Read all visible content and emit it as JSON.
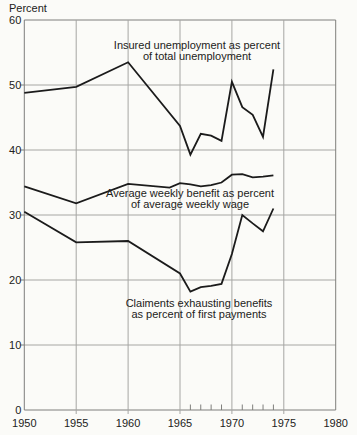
{
  "figure": {
    "unit_label": "Percent",
    "background": "#fbfbf8"
  },
  "chart_data": {
    "type": "line",
    "title": "Percent",
    "xlabel": "",
    "ylabel": "Percent",
    "grid": true,
    "legend_position": "inline-annotations",
    "x_axis": {
      "min": 1950,
      "max": 1980,
      "major_ticks": [
        1950,
        1955,
        1960,
        1965,
        1970,
        1975,
        1980
      ],
      "minor_ticks": [
        1966,
        1967,
        1968,
        1969,
        1971,
        1972,
        1973,
        1974
      ]
    },
    "y_axis": {
      "min": 0,
      "max": 60,
      "ticks": [
        0,
        10,
        20,
        30,
        40,
        50,
        60
      ]
    },
    "series": [
      {
        "name": "insured-unemployment",
        "label_lines": [
          "Insured unemployment as percent",
          "of total unemployment"
        ],
        "label_anchor": {
          "x": 197,
          "y": 48.5
        },
        "points": [
          [
            1950,
            48.8
          ],
          [
            1955,
            49.7
          ],
          [
            1960,
            53.5
          ],
          [
            1965,
            43.7
          ],
          [
            1966,
            39.3
          ],
          [
            1967,
            42.5
          ],
          [
            1968,
            42.2
          ],
          [
            1969,
            41.4
          ],
          [
            1970,
            50.5
          ],
          [
            1971,
            46.6
          ],
          [
            1972,
            45.4
          ],
          [
            1973,
            42.0
          ],
          [
            1974,
            52.4
          ]
        ]
      },
      {
        "name": "average-weekly-benefit",
        "label_lines": [
          "Average weekly benefit as percent",
          "of average weekly wage"
        ],
        "label_anchor": {
          "x": 190,
          "y": 197
        },
        "points": [
          [
            1950,
            34.4
          ],
          [
            1955,
            31.8
          ],
          [
            1960,
            34.8
          ],
          [
            1964,
            34.2
          ],
          [
            1965,
            34.9
          ],
          [
            1966,
            34.7
          ],
          [
            1967,
            34.4
          ],
          [
            1968,
            34.6
          ],
          [
            1969,
            35.0
          ],
          [
            1970,
            36.2
          ],
          [
            1971,
            36.3
          ],
          [
            1972,
            35.8
          ],
          [
            1973,
            35.9
          ],
          [
            1974,
            36.1
          ]
        ]
      },
      {
        "name": "claimants-exhausting-benefits",
        "label_lines": [
          "Claiments exhausting benefits",
          "as percent of first payments"
        ],
        "label_anchor": {
          "x": 199,
          "y": 307
        },
        "points": [
          [
            1950,
            30.5
          ],
          [
            1955,
            25.8
          ],
          [
            1960,
            26.0
          ],
          [
            1965,
            21.0
          ],
          [
            1966,
            18.2
          ],
          [
            1967,
            18.9
          ],
          [
            1968,
            19.1
          ],
          [
            1969,
            19.4
          ],
          [
            1970,
            24.0
          ],
          [
            1971,
            30.0
          ],
          [
            1972,
            28.7
          ],
          [
            1973,
            27.5
          ],
          [
            1974,
            31.0
          ]
        ]
      }
    ],
    "colors": {
      "line": "#1b1b1b",
      "grid": "#a6a6a3",
      "axis": "#7f7f7c",
      "text": "#222220"
    },
    "plot_area_px": {
      "left": 24.3,
      "right": 335.7,
      "top": 20,
      "bottom": 410
    },
    "style_px": {
      "line_width": 1.8,
      "grid_width": 1,
      "tick_font": 11,
      "annotation_font": 11,
      "annotation_line_height": 11,
      "x_label_baseline": 427,
      "unit_label_pos": {
        "x": 9,
        "y": 12
      },
      "y_tick_out": 4,
      "x_major_overshoot": 4,
      "x_minor_tick_len": 5.5
    }
  }
}
